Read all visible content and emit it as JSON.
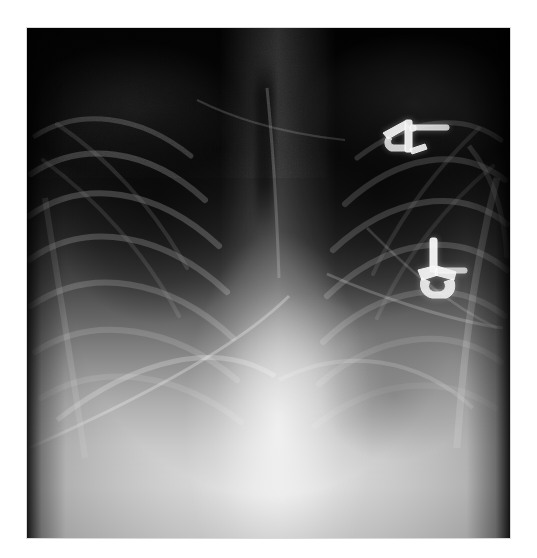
{
  "document": {
    "kind": "medical-image",
    "modality": "X-ray radiograph",
    "body_region": "Chest",
    "projection": "Frontal (AP/PA)",
    "background_color": "#ffffff",
    "alt_text": "Frontal chest radiograph showing dark upper lung fields, bilateral rib arcs, a bright central mediastinum and diaphragm, and two bright metallic surgical devices over the patient's left upper and mid chest."
  },
  "image_frame": {
    "x": 27,
    "y": 28,
    "width": 483,
    "height": 510,
    "border_color": "#d9d9d9",
    "film_color_dark": "#020202",
    "film_color_bright": "#dcdcdc"
  },
  "chart_data": {
    "type": "heatmap",
    "title": "",
    "xlabel": "",
    "ylabel": "",
    "grid": false,
    "legend": "none",
    "colormap": "grayscale",
    "xlim": [
      0,
      483
    ],
    "ylim": [
      0,
      510
    ],
    "intensity_profile_vertical": {
      "note": "Mean grayscale level (0=black, 255=white) sampled top to bottom down the image centre.",
      "y_fraction": [
        0.0,
        0.14,
        0.24,
        0.33,
        0.42,
        0.5,
        0.58,
        0.66,
        0.74,
        0.82,
        0.9,
        1.0
      ],
      "gray_level": [
        2,
        5,
        11,
        24,
        44,
        71,
        106,
        143,
        176,
        201,
        216,
        220
      ]
    },
    "regions": [
      {
        "name": "right-lung-apex",
        "cx_frac": 0.27,
        "cy_frac": 0.18,
        "gray_level": 8,
        "label": "Right upper zone (hyperlucent)"
      },
      {
        "name": "left-lung-apex",
        "cx_frac": 0.73,
        "cy_frac": 0.17,
        "gray_level": 10,
        "label": "Left upper zone (hyperlucent)"
      },
      {
        "name": "mediastinum",
        "cx_frac": 0.52,
        "cy_frac": 0.45,
        "gray_level": 85,
        "label": "Mediastinum / spine"
      },
      {
        "name": "trachea",
        "cx_frac": 0.49,
        "cy_frac": 0.2,
        "gray_level": 18,
        "label": "Tracheal air column"
      },
      {
        "name": "cardiac-silhouette",
        "cx_frac": 0.56,
        "cy_frac": 0.64,
        "gray_level": 150,
        "label": "Cardiac silhouette"
      },
      {
        "name": "right-hemidiaphragm",
        "cx_frac": 0.3,
        "cy_frac": 0.78,
        "gray_level": 190,
        "label": "Right hemidiaphragm"
      },
      {
        "name": "left-hemidiaphragm",
        "cx_frac": 0.7,
        "cy_frac": 0.8,
        "gray_level": 178,
        "label": "Left hemidiaphragm"
      },
      {
        "name": "sub-diaphragm",
        "cx_frac": 0.5,
        "cy_frac": 0.92,
        "gray_level": 218,
        "label": "Upper abdomen (bright)"
      }
    ]
  },
  "findings": {
    "heading": "Visible features",
    "items": [
      {
        "id": "device-upper",
        "name": "Metallic device, left upper chest",
        "x": 385,
        "y": 115,
        "width": 60,
        "height": 45,
        "gray_level": 245
      },
      {
        "id": "device-lower",
        "name": "Metallic device, left mid chest",
        "x": 410,
        "y": 240,
        "width": 55,
        "height": 55,
        "gray_level": 250
      },
      {
        "id": "ribs-right",
        "name": "Right rib cage arcs",
        "count": 7
      },
      {
        "id": "ribs-left",
        "name": "Left rib cage arcs",
        "count": 7
      },
      {
        "id": "tube-oblique",
        "name": "Oblique tube or line over lower chest"
      },
      {
        "id": "tube-vertical",
        "name": "Vertical catheter over mediastinum"
      }
    ]
  }
}
